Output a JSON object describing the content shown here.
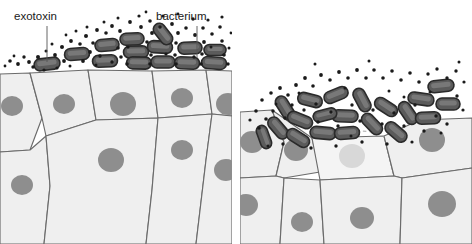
{
  "figure": {
    "width": 472,
    "height": 244,
    "background": "#ffffff"
  },
  "labels": {
    "exotoxin": "exotoxin",
    "bacterium": "bacterium"
  },
  "colors": {
    "background": "#ffffff",
    "cell_fill": "#efefef",
    "cell_fill_alt": "#ebebeb",
    "cell_stroke": "#6b6b6b",
    "nucleus_fill": "#8e8e8e",
    "nucleus_stroke": "#8e8e8e",
    "damaged_cell_fill": "#f4f4f4",
    "damaged_nucleus_fill": "#d8d8d8",
    "damaged_stroke": "#b8b8b8",
    "bacterium_fill": "#5b5b5b",
    "bacterium_stroke": "#2a2a2a",
    "bacterium_highlight": "#8f8f8f",
    "toxin_dot": "#1a1a1a",
    "label_text": "#1a1a1a",
    "leader_line": "#555555"
  },
  "panels": [
    {
      "id": "left-panel",
      "name": "intact-epithelium-panel",
      "description": "Bacteria colonising intact epithelial surface, exotoxin released",
      "x": 0,
      "y": 60,
      "width": 232,
      "height": 184,
      "epithelium_intact": true,
      "damaged_cell": false,
      "bacteria_count": 14,
      "toxin_dot_count": 74,
      "nuclei_count": 9
    },
    {
      "id": "right-panel",
      "name": "damaged-epithelium-panel",
      "description": "Proliferating bacteria and exotoxin have destroyed one epithelial cell",
      "x": 240,
      "y": 60,
      "width": 232,
      "height": 184,
      "epithelium_intact": false,
      "damaged_cell": true,
      "bacteria_count": 20,
      "toxin_dot_count": 66,
      "nuclei_count": 8
    }
  ],
  "annotations": [
    {
      "name": "exotoxin-label",
      "text": "exotoxin",
      "text_x": 14,
      "text_y": 20,
      "leader_from_x": 47,
      "leader_from_y": 26,
      "leader_to_x": 47,
      "leader_to_y": 62,
      "points_to": "small black dots representing secreted toxin molecules"
    },
    {
      "name": "bacterium-label",
      "text": "bacterium",
      "text_x": 156,
      "text_y": 20,
      "leader_from_x": 197,
      "leader_from_y": 26,
      "leader_to_x": 197,
      "leader_to_y": 58,
      "points_to": "dark grey rod-shaped bacterium"
    }
  ],
  "left_bacteria": [
    {
      "cx": 47,
      "cy": 64,
      "rot": -7,
      "w": 26,
      "h": 12
    },
    {
      "cx": 77,
      "cy": 54,
      "rot": -4,
      "w": 25,
      "h": 12
    },
    {
      "cx": 105,
      "cy": 61,
      "rot": -2,
      "w": 25,
      "h": 12
    },
    {
      "cx": 107,
      "cy": 45,
      "rot": -5,
      "w": 24,
      "h": 12
    },
    {
      "cx": 132,
      "cy": 39,
      "rot": -3,
      "w": 24,
      "h": 12
    },
    {
      "cx": 136,
      "cy": 52,
      "rot": -1,
      "w": 25,
      "h": 12
    },
    {
      "cx": 139,
      "cy": 63,
      "rot": 1,
      "w": 25,
      "h": 12
    },
    {
      "cx": 160,
      "cy": 47,
      "rot": 3,
      "w": 25,
      "h": 12
    },
    {
      "cx": 163,
      "cy": 62,
      "rot": 0,
      "w": 24,
      "h": 12
    },
    {
      "cx": 163,
      "cy": 34,
      "rot": 52,
      "w": 24,
      "h": 12
    },
    {
      "cx": 187,
      "cy": 63,
      "rot": 2,
      "w": 25,
      "h": 12
    },
    {
      "cx": 190,
      "cy": 48,
      "rot": -2,
      "w": 24,
      "h": 12
    },
    {
      "cx": 214,
      "cy": 63,
      "rot": 4,
      "w": 25,
      "h": 12
    },
    {
      "cx": 215,
      "cy": 50,
      "rot": 0,
      "w": 22,
      "h": 11
    }
  ],
  "left_toxin_dots": [
    {
      "cx": 38,
      "cy": 57,
      "r": 2.0
    },
    {
      "cx": 29,
      "cy": 62,
      "r": 1.9
    },
    {
      "cx": 18,
      "cy": 64,
      "r": 1.9
    },
    {
      "cx": 10,
      "cy": 61,
      "r": 1.8
    },
    {
      "cx": 24,
      "cy": 57,
      "r": 1.7
    },
    {
      "cx": 33,
      "cy": 67,
      "r": 1.7
    },
    {
      "cx": 55,
      "cy": 55,
      "r": 1.9
    },
    {
      "cx": 64,
      "cy": 61,
      "r": 1.9
    },
    {
      "cx": 62,
      "cy": 47,
      "r": 2.0
    },
    {
      "cx": 71,
      "cy": 41,
      "r": 1.9
    },
    {
      "cx": 80,
      "cy": 44,
      "r": 1.8
    },
    {
      "cx": 86,
      "cy": 36,
      "r": 2.0
    },
    {
      "cx": 93,
      "cy": 43,
      "r": 1.8
    },
    {
      "cx": 90,
      "cy": 52,
      "r": 1.9
    },
    {
      "cx": 83,
      "cy": 61,
      "r": 1.9
    },
    {
      "cx": 97,
      "cy": 30,
      "r": 1.9
    },
    {
      "cx": 106,
      "cy": 33,
      "r": 1.8
    },
    {
      "cx": 112,
      "cy": 26,
      "r": 1.9
    },
    {
      "cx": 120,
      "cy": 31,
      "r": 1.9
    },
    {
      "cx": 118,
      "cy": 48,
      "r": 1.8
    },
    {
      "cx": 121,
      "cy": 57,
      "r": 1.8
    },
    {
      "cx": 127,
      "cy": 64,
      "r": 1.8
    },
    {
      "cx": 112,
      "cy": 62,
      "r": 1.7
    },
    {
      "cx": 100,
      "cy": 56,
      "r": 1.7
    },
    {
      "cx": 130,
      "cy": 22,
      "r": 1.9
    },
    {
      "cx": 141,
      "cy": 27,
      "r": 1.9
    },
    {
      "cx": 150,
      "cy": 21,
      "r": 1.8
    },
    {
      "cx": 152,
      "cy": 33,
      "r": 1.9
    },
    {
      "cx": 147,
      "cy": 42,
      "r": 1.8
    },
    {
      "cx": 151,
      "cy": 55,
      "r": 1.8
    },
    {
      "cx": 150,
      "cy": 64,
      "r": 1.8
    },
    {
      "cx": 160,
      "cy": 27,
      "r": 1.8
    },
    {
      "cx": 172,
      "cy": 24,
      "r": 1.9
    },
    {
      "cx": 178,
      "cy": 33,
      "r": 1.9
    },
    {
      "cx": 176,
      "cy": 43,
      "r": 1.8
    },
    {
      "cx": 175,
      "cy": 55,
      "r": 1.8
    },
    {
      "cx": 176,
      "cy": 64,
      "r": 1.8
    },
    {
      "cx": 186,
      "cy": 28,
      "r": 1.8
    },
    {
      "cx": 195,
      "cy": 35,
      "r": 1.9
    },
    {
      "cx": 203,
      "cy": 28,
      "r": 1.8
    },
    {
      "cx": 204,
      "cy": 42,
      "r": 1.9
    },
    {
      "cx": 202,
      "cy": 54,
      "r": 1.8
    },
    {
      "cx": 201,
      "cy": 64,
      "r": 1.8
    },
    {
      "cx": 212,
      "cy": 34,
      "r": 1.8
    },
    {
      "cx": 220,
      "cy": 27,
      "r": 1.8
    },
    {
      "cx": 222,
      "cy": 41,
      "r": 1.8
    },
    {
      "cx": 224,
      "cy": 55,
      "r": 1.8
    },
    {
      "cx": 228,
      "cy": 64,
      "r": 1.7
    },
    {
      "cx": 194,
      "cy": 57,
      "r": 1.7
    },
    {
      "cx": 166,
      "cy": 54,
      "r": 1.6
    },
    {
      "cx": 128,
      "cy": 47,
      "r": 1.6
    },
    {
      "cx": 44,
      "cy": 70,
      "r": 1.6
    },
    {
      "cx": 57,
      "cy": 68,
      "r": 1.6
    },
    {
      "cx": 70,
      "cy": 66,
      "r": 1.5
    },
    {
      "cx": 96,
      "cy": 65,
      "r": 1.5
    },
    {
      "cx": 193,
      "cy": 19,
      "r": 1.7
    },
    {
      "cx": 163,
      "cy": 16,
      "r": 1.6
    },
    {
      "cx": 139,
      "cy": 16,
      "r": 1.6
    },
    {
      "cx": 208,
      "cy": 20,
      "r": 1.6
    },
    {
      "cx": 222,
      "cy": 17,
      "r": 1.6
    },
    {
      "cx": 118,
      "cy": 18,
      "r": 1.5
    },
    {
      "cx": 104,
      "cy": 22,
      "r": 1.5
    },
    {
      "cx": 87,
      "cy": 27,
      "r": 1.5
    },
    {
      "cx": 76,
      "cy": 31,
      "r": 1.5
    },
    {
      "cx": 66,
      "cy": 35,
      "r": 1.4
    },
    {
      "cx": 52,
      "cy": 44,
      "r": 1.5
    },
    {
      "cx": 46,
      "cy": 51,
      "r": 1.5
    },
    {
      "cx": 14,
      "cy": 56,
      "r": 1.4
    },
    {
      "cx": 5,
      "cy": 66,
      "r": 1.4
    },
    {
      "cx": 211,
      "cy": 47,
      "r": 1.5
    },
    {
      "cx": 229,
      "cy": 48,
      "r": 1.5
    },
    {
      "cx": 231,
      "cy": 33,
      "r": 1.4
    },
    {
      "cx": 146,
      "cy": 12,
      "r": 1.4
    },
    {
      "cx": 178,
      "cy": 14,
      "r": 1.4
    }
  ],
  "right_bacteria": [
    {
      "cx": 285,
      "cy": 108,
      "rot": 58,
      "w": 26,
      "h": 12
    },
    {
      "cx": 278,
      "cy": 128,
      "rot": 50,
      "w": 25,
      "h": 12
    },
    {
      "cx": 300,
      "cy": 120,
      "rot": 22,
      "w": 26,
      "h": 12
    },
    {
      "cx": 310,
      "cy": 100,
      "rot": 14,
      "w": 25,
      "h": 12
    },
    {
      "cx": 323,
      "cy": 133,
      "rot": 5,
      "w": 26,
      "h": 12
    },
    {
      "cx": 298,
      "cy": 138,
      "rot": 32,
      "w": 25,
      "h": 12
    },
    {
      "cx": 336,
      "cy": 95,
      "rot": -22,
      "w": 25,
      "h": 12
    },
    {
      "cx": 345,
      "cy": 116,
      "rot": 2,
      "w": 26,
      "h": 12
    },
    {
      "cx": 347,
      "cy": 133,
      "rot": -4,
      "w": 25,
      "h": 12
    },
    {
      "cx": 362,
      "cy": 100,
      "rot": 62,
      "w": 25,
      "h": 12
    },
    {
      "cx": 372,
      "cy": 124,
      "rot": 46,
      "w": 25,
      "h": 12
    },
    {
      "cx": 386,
      "cy": 107,
      "rot": 33,
      "w": 25,
      "h": 12
    },
    {
      "cx": 396,
      "cy": 132,
      "rot": 40,
      "w": 25,
      "h": 12
    },
    {
      "cx": 408,
      "cy": 113,
      "rot": 56,
      "w": 25,
      "h": 12
    },
    {
      "cx": 421,
      "cy": 99,
      "rot": 8,
      "w": 26,
      "h": 12
    },
    {
      "cx": 428,
      "cy": 118,
      "rot": -2,
      "w": 25,
      "h": 12
    },
    {
      "cx": 441,
      "cy": 86,
      "rot": -6,
      "w": 26,
      "h": 12
    },
    {
      "cx": 448,
      "cy": 104,
      "rot": 0,
      "w": 24,
      "h": 12
    },
    {
      "cx": 325,
      "cy": 115,
      "rot": -14,
      "w": 24,
      "h": 11
    },
    {
      "cx": 264,
      "cy": 137,
      "rot": 70,
      "w": 24,
      "h": 11
    }
  ],
  "right_toxin_dots": [
    {
      "cx": 262,
      "cy": 100,
      "r": 1.8
    },
    {
      "cx": 271,
      "cy": 93,
      "r": 1.8
    },
    {
      "cx": 280,
      "cy": 88,
      "r": 1.9
    },
    {
      "cx": 288,
      "cy": 95,
      "r": 1.8
    },
    {
      "cx": 296,
      "cy": 85,
      "r": 1.9
    },
    {
      "cx": 305,
      "cy": 78,
      "r": 1.9
    },
    {
      "cx": 313,
      "cy": 86,
      "r": 1.8
    },
    {
      "cx": 321,
      "cy": 75,
      "r": 1.9
    },
    {
      "cx": 330,
      "cy": 80,
      "r": 1.8
    },
    {
      "cx": 339,
      "cy": 72,
      "r": 1.9
    },
    {
      "cx": 348,
      "cy": 78,
      "r": 1.8
    },
    {
      "cx": 357,
      "cy": 70,
      "r": 1.9
    },
    {
      "cx": 366,
      "cy": 78,
      "r": 1.8
    },
    {
      "cx": 374,
      "cy": 70,
      "r": 1.8
    },
    {
      "cx": 383,
      "cy": 78,
      "r": 1.8
    },
    {
      "cx": 392,
      "cy": 71,
      "r": 1.8
    },
    {
      "cx": 401,
      "cy": 80,
      "r": 1.8
    },
    {
      "cx": 410,
      "cy": 73,
      "r": 1.8
    },
    {
      "cx": 419,
      "cy": 82,
      "r": 1.8
    },
    {
      "cx": 428,
      "cy": 74,
      "r": 1.7
    },
    {
      "cx": 437,
      "cy": 69,
      "r": 1.7
    },
    {
      "cx": 447,
      "cy": 78,
      "r": 1.7
    },
    {
      "cx": 456,
      "cy": 71,
      "r": 1.7
    },
    {
      "cx": 464,
      "cy": 82,
      "r": 1.6
    },
    {
      "cx": 256,
      "cy": 111,
      "r": 1.8
    },
    {
      "cx": 266,
      "cy": 119,
      "r": 1.8
    },
    {
      "cx": 259,
      "cy": 128,
      "r": 1.7
    },
    {
      "cx": 273,
      "cy": 111,
      "r": 1.7
    },
    {
      "cx": 285,
      "cy": 118,
      "r": 1.7
    },
    {
      "cx": 292,
      "cy": 105,
      "r": 1.7
    },
    {
      "cx": 304,
      "cy": 110,
      "r": 1.7
    },
    {
      "cx": 316,
      "cy": 104,
      "r": 1.7
    },
    {
      "cx": 318,
      "cy": 122,
      "r": 1.7
    },
    {
      "cx": 331,
      "cy": 112,
      "r": 1.7
    },
    {
      "cx": 338,
      "cy": 126,
      "r": 1.7
    },
    {
      "cx": 352,
      "cy": 105,
      "r": 1.7
    },
    {
      "cx": 360,
      "cy": 121,
      "r": 1.7
    },
    {
      "cx": 373,
      "cy": 110,
      "r": 1.7
    },
    {
      "cx": 382,
      "cy": 124,
      "r": 1.7
    },
    {
      "cx": 394,
      "cy": 113,
      "r": 1.7
    },
    {
      "cx": 404,
      "cy": 126,
      "r": 1.7
    },
    {
      "cx": 415,
      "cy": 105,
      "r": 1.7
    },
    {
      "cx": 424,
      "cy": 131,
      "r": 1.7
    },
    {
      "cx": 436,
      "cy": 116,
      "r": 1.7
    },
    {
      "cx": 447,
      "cy": 124,
      "r": 1.7
    },
    {
      "cx": 457,
      "cy": 96,
      "r": 1.7
    },
    {
      "cx": 463,
      "cy": 110,
      "r": 1.6
    },
    {
      "cx": 250,
      "cy": 120,
      "r": 1.6
    },
    {
      "cx": 283,
      "cy": 144,
      "r": 1.7
    },
    {
      "cx": 311,
      "cy": 148,
      "r": 1.7
    },
    {
      "cx": 336,
      "cy": 146,
      "r": 1.7
    },
    {
      "cx": 362,
      "cy": 142,
      "r": 1.7
    },
    {
      "cx": 387,
      "cy": 144,
      "r": 1.7
    },
    {
      "cx": 412,
      "cy": 142,
      "r": 1.6
    },
    {
      "cx": 299,
      "cy": 93,
      "r": 1.5
    },
    {
      "cx": 345,
      "cy": 88,
      "r": 1.5
    },
    {
      "cx": 389,
      "cy": 91,
      "r": 1.5
    },
    {
      "cx": 430,
      "cy": 92,
      "r": 1.5
    },
    {
      "cx": 276,
      "cy": 104,
      "r": 1.5
    },
    {
      "cx": 351,
      "cy": 136,
      "r": 1.5
    },
    {
      "cx": 404,
      "cy": 97,
      "r": 1.5
    },
    {
      "cx": 268,
      "cy": 146,
      "r": 1.5
    },
    {
      "cx": 441,
      "cy": 133,
      "r": 1.5
    },
    {
      "cx": 459,
      "cy": 62,
      "r": 1.5
    },
    {
      "cx": 369,
      "cy": 61,
      "r": 1.5
    },
    {
      "cx": 315,
      "cy": 64,
      "r": 1.5
    }
  ],
  "left_cells": [
    {
      "name": "cell-l1",
      "path": "M0,74 L30,73 L42,118 L30,150 L0,152 Z",
      "nucleus": {
        "cx": 12,
        "cy": 106,
        "rx": 11,
        "ry": 10
      }
    },
    {
      "name": "cell-l2",
      "path": "M30,73 L88,70 L96,120 L46,136 L42,118 Z",
      "nucleus": {
        "cx": 64,
        "cy": 104,
        "rx": 11,
        "ry": 10
      }
    },
    {
      "name": "cell-l3",
      "path": "M88,70 L152,71 L158,118 L96,120 Z",
      "nucleus": {
        "cx": 123,
        "cy": 104,
        "rx": 13,
        "ry": 12
      }
    },
    {
      "name": "cell-l4",
      "path": "M152,71 L206,70 L212,114 L158,118 Z",
      "nucleus": {
        "cx": 182,
        "cy": 98,
        "rx": 11,
        "ry": 10
      }
    },
    {
      "name": "cell-l5",
      "path": "M206,70 L232,71 L232,116 L212,114 Z",
      "nucleus": {
        "cx": 228,
        "cy": 104,
        "rx": 12,
        "ry": 11
      }
    },
    {
      "name": "cell-l6",
      "path": "M0,152 L30,150 L46,136 L50,186 L44,244 L0,244 Z",
      "nucleus": {
        "cx": 22,
        "cy": 185,
        "rx": 11,
        "ry": 10
      }
    },
    {
      "name": "cell-l7",
      "path": "M46,136 L96,120 L158,118 L152,190 L146,244 L44,244 L50,186 Z",
      "nucleus": {
        "cx": 111,
        "cy": 160,
        "rx": 13,
        "ry": 12
      }
    },
    {
      "name": "cell-l8",
      "path": "M158,118 L212,114 L206,160 L196,244 L146,244 L152,190 Z",
      "nucleus": {
        "cx": 182,
        "cy": 150,
        "rx": 11,
        "ry": 10
      }
    },
    {
      "name": "cell-l9",
      "path": "M212,114 L232,116 L232,244 L196,244 L206,160 Z",
      "nucleus": {
        "cx": 226,
        "cy": 170,
        "rx": 12,
        "ry": 11
      }
    }
  ],
  "right_cells": [
    {
      "name": "cell-r1",
      "path": "M240,112 L272,110 L284,142 L276,176 L240,178 Z",
      "nucleus": {
        "cx": 252,
        "cy": 142,
        "rx": 12,
        "ry": 11
      }
    },
    {
      "name": "cell-r2",
      "path": "M272,110 L312,138 L320,172 L284,178 L276,176 L284,142 Z",
      "nucleus": {
        "cx": 296,
        "cy": 150,
        "rx": 12,
        "ry": 11
      }
    },
    {
      "name": "cell-r3-damaged",
      "path": "M312,138 L384,136 L394,176 L320,180 Z",
      "nucleus": {
        "cx": 352,
        "cy": 156,
        "rx": 13,
        "ry": 12
      },
      "damaged": true
    },
    {
      "name": "cell-r4",
      "path": "M384,136 L420,120 L472,118 L472,168 L402,178 L394,176 Z",
      "nucleus": {
        "cx": 432,
        "cy": 140,
        "rx": 13,
        "ry": 12
      }
    },
    {
      "name": "cell-r5",
      "path": "M240,178 L276,176 L284,178 L280,244 L240,244 Z",
      "nucleus": {
        "cx": 246,
        "cy": 205,
        "rx": 12,
        "ry": 11
      }
    },
    {
      "name": "cell-r6",
      "path": "M284,178 L320,180 L324,244 L280,244 Z",
      "nucleus": {
        "cx": 302,
        "cy": 222,
        "rx": 11,
        "ry": 10
      }
    },
    {
      "name": "cell-r7",
      "path": "M320,180 L394,176 L402,178 L400,244 L324,244 Z",
      "nucleus": {
        "cx": 362,
        "cy": 218,
        "rx": 12,
        "ry": 11
      }
    },
    {
      "name": "cell-r8",
      "path": "M402,178 L472,168 L472,244 L400,244 Z",
      "nucleus": {
        "cx": 442,
        "cy": 204,
        "rx": 14,
        "ry": 13
      }
    }
  ],
  "epithelium_surface": {
    "left_top_path": "M0,74 L30,73 L88,70 L152,71 L206,70 L232,71",
    "right_top_path": "M240,112 L272,110 L312,138 L384,136 L420,120 L472,118",
    "right_damage_dashed": "M312,138 L330,132 L352,130 L372,132 L384,136"
  }
}
